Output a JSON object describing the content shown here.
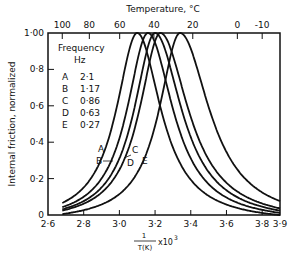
{
  "chart_data": {
    "type": "line",
    "title": "",
    "xlabel": "1/T(K) x 10^3",
    "xlabel_num": "1",
    "xlabel_den": "T(K)",
    "xlabel_suffix": "x10",
    "xlabel_exp": "3",
    "ylabel": "Internal friction, normalized",
    "top_axis_label": "Temperature, °C",
    "xlim": [
      2.6,
      3.9
    ],
    "ylim": [
      0,
      1.0
    ],
    "x_ticks": [
      "2·6",
      "2·8",
      "3·0",
      "3·2",
      "3·4",
      "3·6",
      "3·8",
      "3·9"
    ],
    "y_ticks": [
      "0",
      "0·2",
      "0·4",
      "0·6",
      "0·8",
      "1·00"
    ],
    "top_ticks": [
      "100",
      "80",
      "60",
      "40",
      "20",
      "0",
      "-10"
    ],
    "legend": {
      "title": "Frequency",
      "unit": "Hz",
      "entries": [
        {
          "key": "A",
          "value": "2·1"
        },
        {
          "key": "B",
          "value": "1·17"
        },
        {
          "key": "C",
          "value": "0·86"
        },
        {
          "key": "D",
          "value": "0·63"
        },
        {
          "key": "E",
          "value": "0·27"
        }
      ]
    },
    "series": [
      {
        "name": "A",
        "frequency_hz": 2.1,
        "peak_x": 3.1,
        "peak_y": 1.0
      },
      {
        "name": "B",
        "frequency_hz": 1.17,
        "peak_x": 3.16,
        "peak_y": 1.0
      },
      {
        "name": "C",
        "frequency_hz": 0.86,
        "peak_x": 3.2,
        "peak_y": 1.0
      },
      {
        "name": "D",
        "frequency_hz": 0.63,
        "peak_x": 3.23,
        "peak_y": 1.0
      },
      {
        "name": "E",
        "frequency_hz": 0.27,
        "peak_x": 3.34,
        "peak_y": 1.0
      }
    ],
    "grid": false
  }
}
